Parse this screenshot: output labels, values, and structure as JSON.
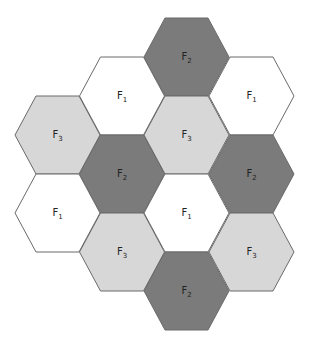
{
  "colors": {
    "F1": "#ffffff",
    "F2": "#7b7b7b",
    "F3": "#d7d7d7",
    "stroke": "#6a6a6a"
  },
  "cells": [
    {
      "label": "F",
      "sub": "2",
      "group": "F2",
      "cx": 186.5,
      "cy": 57
    },
    {
      "label": "F",
      "sub": "1",
      "group": "F1",
      "cx": 122,
      "cy": 96
    },
    {
      "label": "F",
      "sub": "1",
      "group": "F1",
      "cx": 251.5,
      "cy": 96
    },
    {
      "label": "F",
      "sub": "3",
      "group": "F3",
      "cx": 57.5,
      "cy": 135
    },
    {
      "label": "F",
      "sub": "3",
      "group": "F3",
      "cx": 186.5,
      "cy": 135
    },
    {
      "label": "F",
      "sub": "2",
      "group": "F2",
      "cx": 122,
      "cy": 174
    },
    {
      "label": "F",
      "sub": "2",
      "group": "F2",
      "cx": 251.5,
      "cy": 174
    },
    {
      "label": "F",
      "sub": "1",
      "group": "F1",
      "cx": 57.5,
      "cy": 213
    },
    {
      "label": "F",
      "sub": "1",
      "group": "F1",
      "cx": 186.5,
      "cy": 213
    },
    {
      "label": "F",
      "sub": "3",
      "group": "F3",
      "cx": 122,
      "cy": 252
    },
    {
      "label": "F",
      "sub": "3",
      "group": "F3",
      "cx": 251.5,
      "cy": 252
    },
    {
      "label": "F",
      "sub": "2",
      "group": "F2",
      "cx": 186.5,
      "cy": 291
    }
  ]
}
